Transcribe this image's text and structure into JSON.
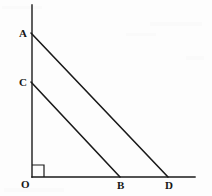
{
  "figure": {
    "background_color": "#fdfdfd",
    "stroke_color": "#1a1a1a",
    "label_color": "#161616",
    "axis_stroke_width": 1.4,
    "segment_stroke_width": 1.6,
    "width": 212,
    "height": 196
  },
  "axes": {
    "vertical": {
      "name": "vertical-axis",
      "x1": 32,
      "y1": 5,
      "x2": 32,
      "y2": 177
    },
    "horizontal": {
      "name": "horizontal-axis",
      "x1": 32,
      "y1": 177,
      "x2": 195,
      "y2": 177
    },
    "right_angle_marker": {
      "name": "right-angle-marker",
      "x": 32,
      "y": 165,
      "size": 12
    }
  },
  "points": [
    {
      "id": "A",
      "label": "A",
      "x": 31,
      "y": 33,
      "label_x": 19,
      "label_y": 28
    },
    {
      "id": "C",
      "label": "C",
      "x": 31,
      "y": 82,
      "label_x": 19,
      "label_y": 77
    },
    {
      "id": "O",
      "label": "O",
      "x": 32,
      "y": 177,
      "label_x": 21,
      "label_y": 179
    },
    {
      "id": "B",
      "label": "B",
      "x": 120,
      "y": 177,
      "label_x": 117,
      "label_y": 180
    },
    {
      "id": "D",
      "label": "D",
      "x": 168,
      "y": 177,
      "label_x": 165,
      "label_y": 180
    }
  ],
  "segments": [
    {
      "id": "AD",
      "name": "segment-a-d",
      "from": "A",
      "to": "D",
      "x1": 31,
      "y1": 33,
      "x2": 168,
      "y2": 177
    },
    {
      "id": "CB",
      "name": "segment-c-b",
      "from": "C",
      "to": "B",
      "x1": 31,
      "y1": 82,
      "x2": 120,
      "y2": 177
    }
  ],
  "intersection": {
    "name": "segment-intersection",
    "x": 90,
    "y": 120
  }
}
